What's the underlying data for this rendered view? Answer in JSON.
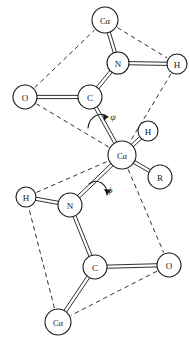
{
  "figure": {
    "type": "molecular-structure-diagram",
    "background_color": "#ffffff",
    "line_color": "#1a1a1a",
    "width": 189,
    "height": 345
  },
  "atoms": [
    {
      "id": "ca-top",
      "label": "Cα",
      "x": 105,
      "y": 20,
      "r": 13
    },
    {
      "id": "n-top",
      "label": "N",
      "x": 118,
      "y": 63,
      "r": 11
    },
    {
      "id": "h-top-right",
      "label": "H",
      "x": 177,
      "y": 64,
      "r": 10
    },
    {
      "id": "o-left",
      "label": "O",
      "x": 25,
      "y": 97,
      "r": 12
    },
    {
      "id": "c-upper",
      "label": "C",
      "x": 90,
      "y": 97,
      "r": 12
    },
    {
      "id": "ca-center",
      "label": "Cα",
      "x": 122,
      "y": 155,
      "r": 14
    },
    {
      "id": "h-center",
      "label": "H",
      "x": 148,
      "y": 131,
      "r": 10
    },
    {
      "id": "r-group",
      "label": "R",
      "x": 160,
      "y": 177,
      "r": 12
    },
    {
      "id": "n-bottom",
      "label": "N",
      "x": 70,
      "y": 205,
      "r": 12
    },
    {
      "id": "h-bottom-left",
      "label": "H",
      "x": 26,
      "y": 197,
      "r": 10
    },
    {
      "id": "c-lower",
      "label": "C",
      "x": 95,
      "y": 267,
      "r": 12
    },
    {
      "id": "o-right",
      "label": "O",
      "x": 169,
      "y": 265,
      "r": 12
    },
    {
      "id": "ca-bottom",
      "label": "Cα",
      "x": 58,
      "y": 322,
      "r": 13
    }
  ],
  "bonds": [
    {
      "from": "ca-top",
      "to": "n-top",
      "style": "double"
    },
    {
      "from": "n-top",
      "to": "h-top-right",
      "style": "double"
    },
    {
      "from": "n-top",
      "to": "c-upper",
      "style": "double"
    },
    {
      "from": "o-left",
      "to": "c-upper",
      "style": "double"
    },
    {
      "from": "c-upper",
      "to": "ca-center",
      "style": "double"
    },
    {
      "from": "ca-center",
      "to": "h-center",
      "style": "double"
    },
    {
      "from": "ca-center",
      "to": "r-group",
      "style": "double"
    },
    {
      "from": "ca-center",
      "to": "n-bottom",
      "style": "double"
    },
    {
      "from": "n-bottom",
      "to": "h-bottom-left",
      "style": "double"
    },
    {
      "from": "n-bottom",
      "to": "c-lower",
      "style": "double"
    },
    {
      "from": "c-lower",
      "to": "o-right",
      "style": "double"
    },
    {
      "from": "c-lower",
      "to": "ca-bottom",
      "style": "double"
    }
  ],
  "plane_outlines": [
    {
      "id": "upper-peptide-plane",
      "style": "dashed",
      "vertices": [
        "ca-top",
        "h-top-right",
        "ca-center",
        "o-left"
      ]
    },
    {
      "id": "lower-peptide-plane",
      "style": "dashed",
      "vertices": [
        "h-bottom-left",
        "ca-center",
        "o-right",
        "ca-bottom"
      ]
    }
  ],
  "angle_markers": [
    {
      "id": "psi-angle",
      "symbol": "ψ",
      "label_x": 113,
      "label_y": 118,
      "pivot_x": 104,
      "pivot_y": 124,
      "description": "psi rotation about C-alpha to carbonyl carbon bond"
    },
    {
      "id": "phi-angle",
      "symbol": "ϕ",
      "label_x": 110,
      "label_y": 190,
      "pivot_x": 99,
      "pivot_y": 184,
      "description": "phi rotation about N to C-alpha bond"
    }
  ]
}
